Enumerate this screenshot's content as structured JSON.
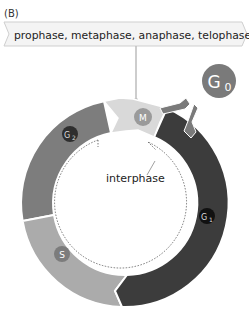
{
  "panel_label": "(B)",
  "mitosis_banner": "prophase, metaphase, anaphase, telophase",
  "center_label": "interphase",
  "phases": {
    "M": {
      "label": "M",
      "color": "#d9d9d9",
      "badge_color": "#9a9a9a"
    },
    "G1": {
      "label": "G",
      "sub": "1",
      "color": "#3c3c3c",
      "badge_color": "#111111"
    },
    "S": {
      "label": "S",
      "color": "#ababab",
      "badge_color": "#7c7c7c"
    },
    "G2": {
      "label": "G",
      "sub": "2",
      "color": "#7d7d7d",
      "badge_color": "#2e2e2e"
    },
    "G0": {
      "label": "G",
      "sub": "0",
      "color": "#7a7a7a"
    }
  }
}
